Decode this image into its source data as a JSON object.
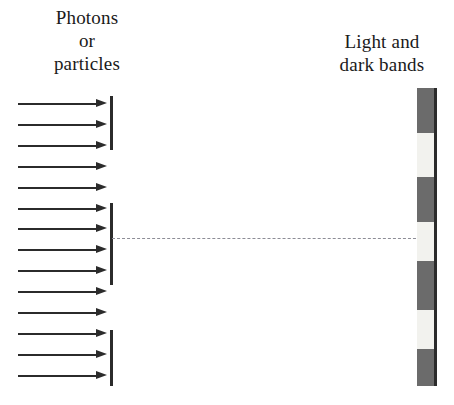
{
  "diagram": {
    "source_label": "Photons\nor\nparticles",
    "screen_label": "Light and\ndark bands",
    "colors": {
      "ink": "#2b2b2b",
      "dark_band": "#6b6b6b",
      "light_band": "#f2f2ee",
      "dashed_line": "#8d8d96",
      "background": "#ffffff"
    },
    "arrows": {
      "count": 14,
      "direction": "right",
      "x_start": 18,
      "x_end": 107,
      "y_positions": [
        103,
        124,
        145,
        166,
        187,
        208,
        228,
        249,
        270,
        291,
        312,
        333,
        354,
        375
      ]
    },
    "barrier": {
      "x": 110,
      "segments": [
        {
          "y_top": 96,
          "y_bottom": 150
        },
        {
          "y_top": 203,
          "y_bottom": 285
        },
        {
          "y_top": 330,
          "y_bottom": 386
        }
      ],
      "slit_count": 2
    },
    "centerline": {
      "x_start": 112,
      "x_end": 421,
      "y": 238,
      "style": "dashed"
    },
    "screen": {
      "x": 417,
      "y_top": 88,
      "width": 20,
      "height": 298,
      "bands": [
        {
          "type": "dark",
          "height": 45
        },
        {
          "type": "light",
          "height": 44
        },
        {
          "type": "dark",
          "height": 45
        },
        {
          "type": "light",
          "height": 39
        },
        {
          "type": "dark",
          "height": 49
        },
        {
          "type": "light",
          "height": 39
        },
        {
          "type": "dark",
          "height": 37
        }
      ]
    }
  }
}
